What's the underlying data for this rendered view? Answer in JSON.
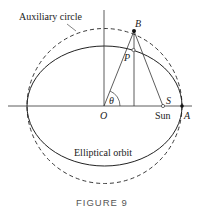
{
  "diagram": {
    "labels": {
      "auxiliary_circle": "Auxiliary circle",
      "elliptical_orbit": "Elliptical orbit",
      "point_b": "B",
      "point_p": "P",
      "point_s": "S",
      "point_o": "O",
      "point_a": "A",
      "sun": "Sun",
      "angle": "θ"
    },
    "caption": "FIGURE 9"
  }
}
